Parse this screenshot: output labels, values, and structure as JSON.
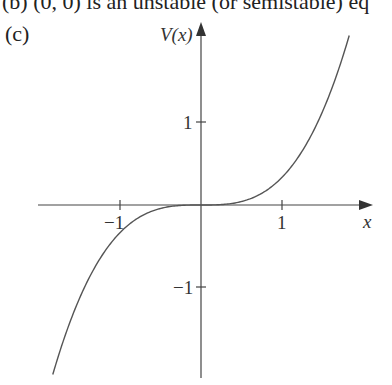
{
  "header": {
    "cut_line": "(b)  (0, 0) is an unstable (or semistable) eq",
    "part_label": "(c)"
  },
  "chart_data": {
    "type": "line",
    "title": "",
    "xlabel": "x",
    "ylabel": "V(x)",
    "xlim": [
      -1.95,
      2.1
    ],
    "ylim": [
      -2.1,
      2.15
    ],
    "xticks": [
      -1,
      1
    ],
    "xtick_labels": [
      "−1",
      "1"
    ],
    "yticks": [
      1,
      -1
    ],
    "ytick_labels": [
      "1",
      "−1"
    ],
    "grid": false,
    "legend": null,
    "series": [
      {
        "name": "V(x)",
        "description": "odd cubic, V(x) ≈ x³/3, flat at origin",
        "x": [
          -1.83,
          -1.5,
          -1.25,
          -1.0,
          -0.75,
          -0.5,
          -0.25,
          0,
          0.25,
          0.5,
          0.75,
          1.0,
          1.25,
          1.5,
          1.83
        ],
        "y": [
          -2.04,
          -1.13,
          -0.65,
          -0.33,
          -0.14,
          -0.04,
          -0.005,
          0,
          0.005,
          0.04,
          0.14,
          0.33,
          0.65,
          1.13,
          2.04
        ]
      }
    ]
  },
  "plot": {
    "origin_px": [
      201,
      205
    ],
    "unit_px_x": 81,
    "unit_px_y": 83,
    "curve_color": "#555555",
    "axis_color": "#444444"
  }
}
